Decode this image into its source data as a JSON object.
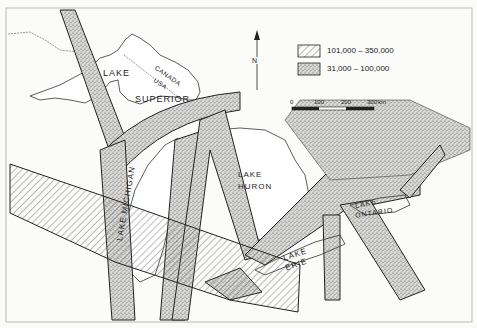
{
  "map": {
    "lakes": [
      {
        "name": "lake-superior",
        "lines": [
          "LAKE",
          "SUPERIOR"
        ]
      },
      {
        "name": "lake-michigan",
        "label": "LAKE MICHIGAN"
      },
      {
        "name": "lake-huron",
        "lines": [
          "LAKE",
          "HURON"
        ]
      },
      {
        "name": "lake-erie",
        "lines": [
          "LAKE",
          "ERIE"
        ]
      },
      {
        "name": "lake-ontario",
        "lines": [
          "LAKE",
          "ONTARIO"
        ]
      }
    ],
    "border_labels": {
      "canada": "CANADA",
      "usa": "USA"
    },
    "north_arrow": "N",
    "legend": [
      {
        "pattern": "hatched",
        "label": "101,000 – 350,000"
      },
      {
        "pattern": "stippled",
        "label": "31,000 – 100,000"
      }
    ],
    "scale_bar": {
      "ticks": [
        "0",
        "100",
        "200",
        "300"
      ],
      "unit": "km"
    },
    "colors": {
      "ink": "#222222",
      "paper": "#fbfbf9",
      "stipple": "#8a8a8a"
    }
  }
}
